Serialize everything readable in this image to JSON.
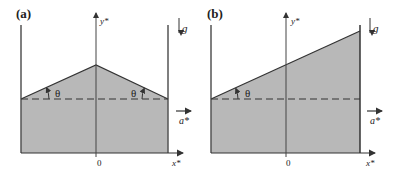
{
  "panels": [
    {
      "label": "(a)",
      "y_axis_label": "y*",
      "x_axis_label": "x*",
      "origin_label": "0",
      "gravity_label": "g",
      "acceleration_label": "a*",
      "angle_labels": [
        "θ",
        "θ"
      ],
      "surface": "symmetric-peak"
    },
    {
      "label": "(b)",
      "y_axis_label": "y*",
      "x_axis_label": "x*",
      "origin_label": "0",
      "gravity_label": "g",
      "acceleration_label": "a*",
      "angle_labels": [
        "θ"
      ],
      "surface": "inclined-plane"
    }
  ],
  "colors": {
    "fluid": "#b8b8b8",
    "line": "#333333"
  }
}
